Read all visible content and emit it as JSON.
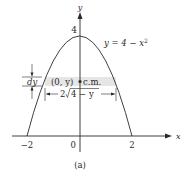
{
  "figure": {
    "caption": "(a)",
    "curve_label": "y = 4 − x",
    "curve_label_exp": "2",
    "axis_x_label": "x",
    "axis_y_label": "y",
    "tick_x_neg2": "−2",
    "tick_x_0": "0",
    "tick_x_2": "2",
    "tick_y_4": "4",
    "strip_dy_label": "dy",
    "strip_point_label": "(0, y)",
    "strip_cm_label": "c.m.",
    "strip_width_prefix": "2",
    "strip_width_radicand": "4 − y",
    "colors": {
      "ink": "#2a2a2a",
      "strip_fill": "#e6e6e6"
    }
  }
}
